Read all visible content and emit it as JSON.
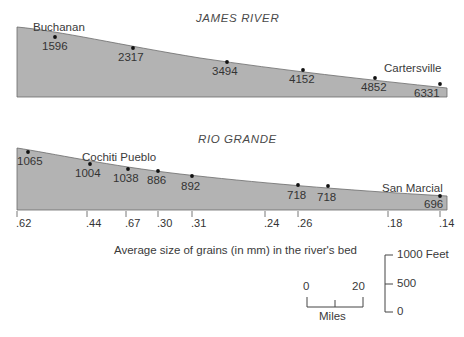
{
  "figure": {
    "caption": "Average size of grains (in mm) in the river's bed"
  },
  "chart_data": {
    "type": "area",
    "title": "Average size of grains (in mm) in the river's bed",
    "xlabel": "Miles",
    "ylabel": "Feet",
    "grid": false,
    "legend": "none",
    "panels": [
      {
        "name": "james-river",
        "title": "JAMES RIVER",
        "place_labels": [
          {
            "text": "Buchanan",
            "x_px": 33,
            "y_px": 22
          },
          {
            "text": "Cartersville",
            "x_px": 384,
            "y_px": 63
          }
        ],
        "points": [
          {
            "value": "1596",
            "x_px": 55,
            "y_px": 37,
            "label_x": 42,
            "label_y": 41
          },
          {
            "value": "2317",
            "x_px": 133,
            "y_px": 48,
            "label_x": 118,
            "label_y": 52
          },
          {
            "value": "3494",
            "x_px": 227,
            "y_px": 62,
            "label_x": 212,
            "label_y": 66
          },
          {
            "value": "4152",
            "x_px": 303,
            "y_px": 70,
            "label_x": 289,
            "label_y": 74
          },
          {
            "value": "4852",
            "x_px": 375,
            "y_px": 78,
            "label_x": 361,
            "label_y": 82
          },
          {
            "value": "6331",
            "x_px": 440,
            "y_px": 84,
            "label_x": 414,
            "label_y": 88
          }
        ],
        "profile_path": "M 17,97 L 17,27 C 60,31 120,45 200,58 C 280,70 370,80 447,88 L 447,97 Z"
      },
      {
        "name": "rio-grande",
        "title": "RIO GRANDE",
        "place_labels": [
          {
            "text": "Cochiti Pueblo",
            "x_px": 82,
            "y_px": 152
          },
          {
            "text": "San Marcial",
            "x_px": 382,
            "y_px": 183
          }
        ],
        "points": [
          {
            "value": "1065",
            "x_px": 28,
            "y_px": 152,
            "label_x": 17,
            "label_y": 156
          },
          {
            "value": "1004",
            "x_px": 90,
            "y_px": 164,
            "label_x": 75,
            "label_y": 168
          },
          {
            "value": "1038",
            "x_px": 128,
            "y_px": 169,
            "label_x": 113,
            "label_y": 173
          },
          {
            "value": "886",
            "x_px": 158,
            "y_px": 171,
            "label_x": 147,
            "label_y": 175
          },
          {
            "value": "892",
            "x_px": 192,
            "y_px": 176,
            "label_x": 181,
            "label_y": 181
          },
          {
            "value": "718",
            "x_px": 298,
            "y_px": 185,
            "label_x": 287,
            "label_y": 190
          },
          {
            "value": "718",
            "x_px": 328,
            "y_px": 186,
            "label_x": 317,
            "label_y": 192
          },
          {
            "value": "696",
            "x_px": 440,
            "y_px": 196,
            "label_x": 424,
            "label_y": 199
          }
        ],
        "profile_path": "M 17,210 L 17,148 C 50,153 110,166 180,174 C 250,182 340,190 447,196 L 447,210 Z",
        "grain_size_ticks": [
          {
            "label": ".62",
            "x_px": 17
          },
          {
            "label": ".44",
            "x_px": 87
          },
          {
            "label": ".67",
            "x_px": 126
          },
          {
            "label": ".30",
            "x_px": 158
          },
          {
            "label": ".31",
            "x_px": 192
          },
          {
            "label": ".24",
            "x_px": 265
          },
          {
            "label": ".26",
            "x_px": 298
          },
          {
            "label": ".18",
            "x_px": 388
          },
          {
            "label": ".14",
            "x_px": 440
          }
        ]
      }
    ],
    "scales": {
      "distance": {
        "unit_label": "Miles",
        "min_label": "0",
        "max_label": "20",
        "midpoint_tick": true
      },
      "elevation": {
        "unit_label": "Feet",
        "ticks": [
          "1000 Feet",
          "500",
          "0"
        ]
      }
    }
  }
}
